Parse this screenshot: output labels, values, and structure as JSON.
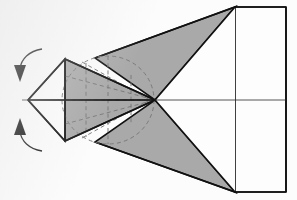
{
  "figure": {
    "background_color": "#fcfcfc",
    "shade_color": "#a9a9a9",
    "line_color": "#111111",
    "hidden_line_color": "#7a7a7a",
    "canvas": {
      "width": 297,
      "height": 200
    }
  },
  "geometry": {
    "apex_left": {
      "x": 28,
      "y": 100
    },
    "focus_center": {
      "x": 155,
      "y": 100
    },
    "cone_base_top": {
      "x": 65,
      "y": 59
    },
    "cone_base_bottom": {
      "x": 65,
      "y": 141
    },
    "rect_left_x": 235,
    "rect_right_x": 286,
    "rect_top_y": 7,
    "rect_bottom_y": 192,
    "axis_y": 100
  },
  "shapes": {
    "left_outline_triangle": {
      "name": "left-white-triangle",
      "points": "28,100 65,59 65,141",
      "fill": "#fdfdfd"
    },
    "cone_body": {
      "name": "shaded-cone-body",
      "points": "65,59 155,100 65,141",
      "fill": "#a9a9a9"
    },
    "upper_shaded_wing": {
      "name": "upper-shaded-wing",
      "points": "95,58 235,7 155,100",
      "fill": "#a9a9a9"
    },
    "lower_shaded_wing": {
      "name": "lower-shaded-wing",
      "points": "95,142 235,192 155,100",
      "fill": "#a9a9a9"
    },
    "right_panel": {
      "name": "right-rectangle-panel",
      "points": "235,7 286,7 286,192 235,192",
      "fill": "#fdfdfd"
    },
    "upper_white_triangle": {
      "name": "upper-white-triangle",
      "points": "155,100 235,7 235,100",
      "fill": "#fdfdfd"
    },
    "lower_white_triangle": {
      "name": "lower-white-triangle",
      "points": "155,100 235,192 235,100",
      "fill": "#fdfdfd"
    }
  },
  "hidden_lines": {
    "name": "dashed-hidden-construction-lines",
    "ellipse": {
      "cx": 108,
      "cy": 100,
      "rx": 46,
      "ry": 44
    },
    "rays": [
      "65,59 155,100",
      "65,141 155,100",
      "65,76 155,100",
      "65,124 155,100",
      "65,100 155,100",
      "82,62 148,100",
      "82,138 148,100"
    ],
    "verticals": [
      "108,56 108,144",
      "85,63 85,137",
      "131,74 131,126"
    ]
  },
  "arrows": {
    "top": {
      "name": "rotation-arrow-top",
      "curve": "M 40,50 C 28,52 21,60 20,70",
      "head": "20,82 14,66 26,66",
      "direction": "down"
    },
    "bottom": {
      "name": "rotation-arrow-bottom",
      "curve": "M 40,150 C 28,148 21,140 20,130",
      "head": "20,118 14,134 26,134",
      "direction": "up"
    }
  },
  "axis_line": {
    "name": "horizontal-axis",
    "from": {
      "x": 22,
      "y": 100
    },
    "to": {
      "x": 286,
      "y": 100
    }
  },
  "labels": {
    "caption": ""
  }
}
